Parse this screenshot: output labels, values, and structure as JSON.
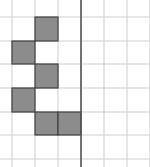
{
  "diagram": {
    "type": "grid-symmetry-puzzle",
    "grid": {
      "columns": 7,
      "rows": 7,
      "line_color": "#cfcfcf",
      "axis_color": "#555555",
      "fill_color": "#8c8c8c",
      "border_color": "#404040"
    },
    "vertical_lines_x": [
      12,
      35,
      58,
      81,
      104,
      127,
      150
    ],
    "horizontal_lines_y": [
      17,
      41,
      64,
      88,
      112,
      135,
      159
    ],
    "mirror_axis_x": 81,
    "filled_cells": [
      {
        "row": 0,
        "col": 1
      },
      {
        "row": 1,
        "col": 0
      },
      {
        "row": 2,
        "col": 1
      },
      {
        "row": 3,
        "col": 0
      },
      {
        "row": 4,
        "col": 1
      },
      {
        "row": 4,
        "col": 2
      }
    ]
  }
}
